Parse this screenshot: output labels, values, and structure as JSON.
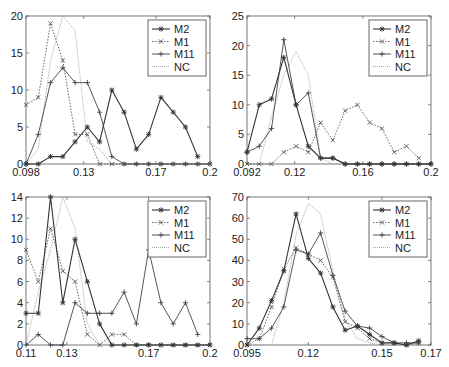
{
  "figure": {
    "width": 449,
    "height": 367,
    "layout": "2x2"
  },
  "chart_data": [
    {
      "type": "line",
      "panel": "top-left",
      "title": "",
      "xlabel": "",
      "ylabel": "",
      "xlim": [
        0.098,
        0.2
      ],
      "ylim": [
        0,
        20
      ],
      "xticks": [
        0.098,
        0.13,
        0.17,
        0.2
      ],
      "xtick_labels": [
        "0.098",
        "0.13",
        "0.17",
        "0.2"
      ],
      "yticks": [
        0,
        5,
        10,
        15,
        20
      ],
      "x": [
        0.098,
        0.1048,
        0.1116,
        0.1184,
        0.1252,
        0.132,
        0.1388,
        0.1456,
        0.1524,
        0.1592,
        0.166,
        0.1728,
        0.1796,
        0.1864,
        0.1932,
        0.2
      ],
      "series": [
        {
          "name": "M2",
          "values": [
            0,
            0,
            1,
            1,
            3,
            5,
            3,
            10,
            7,
            2,
            4,
            9,
            7,
            5,
            1,
            null
          ]
        },
        {
          "name": "M1",
          "values": [
            8,
            9,
            19,
            14,
            4,
            4,
            0,
            0,
            0,
            0,
            0,
            0,
            0,
            0,
            0,
            0
          ]
        },
        {
          "name": "M11",
          "values": [
            0,
            4,
            11,
            13,
            11,
            11,
            7,
            1,
            0,
            0,
            0,
            0,
            0,
            0,
            0,
            0
          ]
        },
        {
          "name": "NC",
          "values": [
            0,
            2,
            14,
            20,
            18,
            3,
            2,
            0,
            0,
            0,
            0,
            0,
            0,
            0,
            0,
            0
          ]
        }
      ],
      "legend": {
        "position": "upper right",
        "entries": [
          "M2",
          "M1",
          "M11",
          "NC"
        ]
      },
      "grid": false
    },
    {
      "type": "line",
      "panel": "top-right",
      "title": "",
      "xlabel": "",
      "ylabel": "",
      "xlim": [
        0.092,
        0.2
      ],
      "ylim": [
        0,
        25
      ],
      "xticks": [
        0.092,
        0.12,
        0.16,
        0.2
      ],
      "xtick_labels": [
        "0.092",
        "0.12",
        "0.16",
        "0.2"
      ],
      "yticks": [
        0,
        5,
        10,
        15,
        20,
        25
      ],
      "x": [
        0.092,
        0.0992,
        0.1064,
        0.1136,
        0.1208,
        0.128,
        0.1352,
        0.1424,
        0.1496,
        0.1568,
        0.164,
        0.1712,
        0.1784,
        0.1856,
        0.1928,
        0.2
      ],
      "series": [
        {
          "name": "M2",
          "values": [
            2,
            10,
            11,
            18,
            10,
            3,
            1,
            1,
            0,
            0,
            0,
            0,
            0,
            0,
            0,
            0
          ]
        },
        {
          "name": "M1",
          "values": [
            0,
            0,
            0,
            2,
            3,
            2,
            7,
            4,
            9,
            10,
            7,
            6,
            2,
            3,
            1,
            null
          ]
        },
        {
          "name": "M11",
          "values": [
            2,
            3,
            6,
            21,
            10,
            12,
            1,
            1,
            0,
            0,
            0,
            0,
            0,
            0,
            0,
            0
          ]
        },
        {
          "name": "NC",
          "values": [
            0,
            0,
            8,
            15,
            19,
            15,
            1,
            0,
            0,
            0,
            0,
            0,
            0,
            0,
            0,
            0
          ]
        }
      ],
      "legend": {
        "position": "upper right",
        "entries": [
          "M2",
          "M1",
          "M11",
          "NC"
        ]
      },
      "grid": false
    },
    {
      "type": "line",
      "panel": "bottom-left",
      "title": "",
      "xlabel": "",
      "ylabel": "",
      "xlim": [
        0.11,
        0.2
      ],
      "ylim": [
        0,
        14
      ],
      "xticks": [
        0.11,
        0.13,
        0.17,
        0.2
      ],
      "xtick_labels": [
        "0.11",
        "0.13",
        "0.17",
        "0.2"
      ],
      "yticks": [
        0,
        2,
        4,
        6,
        8,
        10,
        12,
        14
      ],
      "x": [
        0.11,
        0.116,
        0.122,
        0.128,
        0.134,
        0.14,
        0.146,
        0.152,
        0.158,
        0.164,
        0.17,
        0.176,
        0.182,
        0.188,
        0.194,
        0.2
      ],
      "series": [
        {
          "name": "M2",
          "values": [
            3,
            3,
            14,
            4,
            10,
            6,
            2,
            0,
            0,
            0,
            0,
            0,
            0,
            0,
            0,
            0
          ]
        },
        {
          "name": "M1",
          "values": [
            9,
            6,
            11,
            7,
            6,
            1,
            0,
            1,
            1,
            0,
            0,
            0,
            0,
            0,
            0,
            0
          ]
        },
        {
          "name": "M11",
          "values": [
            0,
            1,
            0,
            0,
            4,
            3,
            3,
            3,
            5,
            2,
            9,
            4,
            2,
            4,
            1,
            null
          ]
        },
        {
          "name": "NC",
          "values": [
            0,
            5,
            9,
            14,
            11,
            2,
            0,
            0,
            0,
            0,
            0,
            0,
            0,
            0,
            0,
            0
          ]
        }
      ],
      "legend": {
        "position": "upper right",
        "entries": [
          "M2",
          "M1",
          "M11",
          "NC"
        ]
      },
      "grid": false
    },
    {
      "type": "line",
      "panel": "bottom-right",
      "title": "",
      "xlabel": "",
      "ylabel": "",
      "xlim": [
        0.095,
        0.17
      ],
      "ylim": [
        0,
        70
      ],
      "xticks": [
        0.095,
        0.12,
        0.15,
        0.17
      ],
      "xtick_labels": [
        "0.095",
        "0.12",
        "0.15",
        "0.17"
      ],
      "yticks": [
        0,
        10,
        20,
        30,
        40,
        50,
        60,
        70
      ],
      "x": [
        0.095,
        0.1,
        0.105,
        0.11,
        0.115,
        0.12,
        0.125,
        0.13,
        0.135,
        0.14,
        0.145,
        0.15,
        0.155,
        0.16,
        0.165,
        0.17
      ],
      "series": [
        {
          "name": "M2",
          "values": [
            0,
            8,
            21,
            35,
            62,
            41,
            34,
            18,
            7,
            9,
            5,
            1,
            1,
            0,
            2,
            null
          ]
        },
        {
          "name": "M1",
          "values": [
            0,
            3,
            18,
            36,
            46,
            43,
            40,
            32,
            11,
            8,
            3,
            1,
            1,
            0,
            1,
            null
          ]
        },
        {
          "name": "M11",
          "values": [
            3,
            3,
            8,
            18,
            45,
            43,
            53,
            33,
            16,
            9,
            8,
            4,
            1,
            1,
            1,
            null
          ]
        },
        {
          "name": "NC",
          "values": [
            0,
            0,
            0,
            20,
            52,
            67,
            62,
            35,
            12,
            3,
            1,
            0,
            0,
            0,
            0,
            null
          ]
        }
      ],
      "legend": {
        "position": "upper right",
        "entries": [
          "M2",
          "M1",
          "M11",
          "NC"
        ]
      },
      "grid": false
    }
  ],
  "styles": {
    "M2": {
      "color": "#333333",
      "dash": "",
      "marker": "star",
      "width": 1.1
    },
    "M1": {
      "color": "#555555",
      "dash": "1.5,1.5",
      "marker": "x",
      "width": 0.9
    },
    "M11": {
      "color": "#444444",
      "dash": "",
      "marker": "plus",
      "width": 0.9
    },
    "NC": {
      "color": "#aaaaaa",
      "dash": "1,1",
      "marker": "none",
      "width": 1.0
    }
  },
  "panels_layout": [
    {
      "left": 26,
      "top": 16,
      "width": 184,
      "height": 148
    },
    {
      "left": 247,
      "top": 16,
      "width": 184,
      "height": 148
    },
    {
      "left": 26,
      "top": 197,
      "width": 184,
      "height": 148
    },
    {
      "left": 247,
      "top": 197,
      "width": 184,
      "height": 148
    }
  ]
}
